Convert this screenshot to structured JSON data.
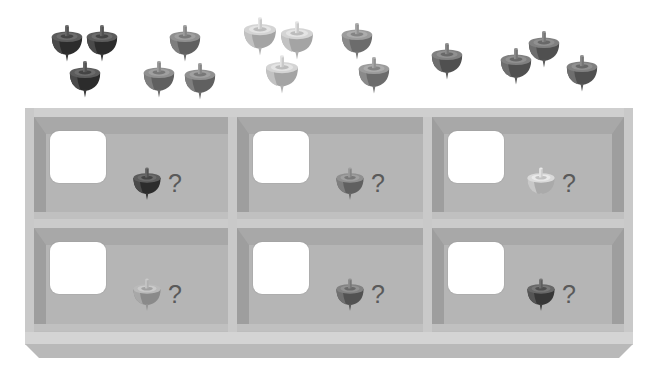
{
  "task": {
    "name": "spinning-tops-counting",
    "instruction_text": "",
    "question_symbol": "?"
  },
  "palette": {
    "background": "#ffffff",
    "shelf_frame": "#cfcfcf",
    "shelf_interior": "#b5b5b5",
    "shelf_ceiling_shadow": "#a8a8a8",
    "shelf_sidewall": "#9e9e9e",
    "answer_box": "#ffffff",
    "question_mark": "#5a5a5a",
    "top_dark": "#4a4a4a",
    "top_medium_dark": "#6e6e6e",
    "top_medium": "#7e7e7e",
    "top_light_medium": "#a3a3a3",
    "top_light": "#c2c2c2"
  },
  "scatter": {
    "label": "scattered-spinning-tops",
    "total_count": 14,
    "groups": [
      {
        "name": "group-dark-left",
        "shade": "dark",
        "color": "#4a4a4a",
        "count": 3,
        "tops": [
          {
            "x": 48,
            "y": 20,
            "size": 38,
            "color": "#4a4a4a"
          },
          {
            "x": 83,
            "y": 20,
            "size": 38,
            "color": "#4a4a4a"
          },
          {
            "x": 66,
            "y": 56,
            "size": 38,
            "color": "#4a4a4a"
          }
        ]
      },
      {
        "name": "group-medium-second",
        "shade": "medium",
        "color": "#7e7e7e",
        "count": 3,
        "tops": [
          {
            "x": 166,
            "y": 20,
            "size": 38,
            "color": "#7e7e7e"
          },
          {
            "x": 140,
            "y": 56,
            "size": 38,
            "color": "#7e7e7e"
          },
          {
            "x": 181,
            "y": 58,
            "size": 38,
            "color": "#7e7e7e"
          }
        ]
      },
      {
        "name": "group-light-third",
        "shade": "light",
        "color": "#c2c2c2",
        "count": 3,
        "tops": [
          {
            "x": 240,
            "y": 12,
            "size": 40,
            "color": "#c2c2c2"
          },
          {
            "x": 277,
            "y": 16,
            "size": 40,
            "color": "#c2c2c2"
          },
          {
            "x": 262,
            "y": 50,
            "size": 40,
            "color": "#c2c2c2"
          }
        ]
      },
      {
        "name": "group-medium-fourth",
        "shade": "medium",
        "color": "#8a8a8a",
        "count": 2,
        "tops": [
          {
            "x": 338,
            "y": 18,
            "size": 38,
            "color": "#8a8a8a"
          },
          {
            "x": 355,
            "y": 52,
            "size": 38,
            "color": "#8a8a8a"
          }
        ]
      },
      {
        "name": "group-medium-dark-right",
        "shade": "medium-dark",
        "color": "#6e6e6e",
        "count": 3,
        "tops": [
          {
            "x": 428,
            "y": 38,
            "size": 38,
            "color": "#6e6e6e"
          },
          {
            "x": 497,
            "y": 43,
            "size": 38,
            "color": "#6e6e6e"
          },
          {
            "x": 525,
            "y": 26,
            "size": 38,
            "color": "#6e6e6e"
          }
        ]
      }
    ],
    "extra_tops": [
      {
        "name": "top-far-right-low",
        "x": 563,
        "y": 50,
        "size": 38,
        "color": "#6e6e6e"
      }
    ]
  },
  "shelf": {
    "label": "shelf-grid",
    "rows": 2,
    "columns": 3,
    "cells": [
      {
        "id": "cell-r1c1",
        "row": 1,
        "column": 1,
        "answer_value": "",
        "reference_top": {
          "shade": "dark",
          "color": "#4a4a4a"
        },
        "question": "?"
      },
      {
        "id": "cell-r1c2",
        "row": 1,
        "column": 2,
        "answer_value": "",
        "reference_top": {
          "shade": "medium",
          "color": "#7e7e7e"
        },
        "question": "?"
      },
      {
        "id": "cell-r1c3",
        "row": 1,
        "column": 3,
        "answer_value": "",
        "reference_top": {
          "shade": "light",
          "color": "#c8c8c8"
        },
        "question": "?"
      },
      {
        "id": "cell-r2c1",
        "row": 2,
        "column": 1,
        "answer_value": "",
        "reference_top": {
          "shade": "light-medium",
          "color": "#a8a8a8"
        },
        "question": "?"
      },
      {
        "id": "cell-r2c2",
        "row": 2,
        "column": 2,
        "answer_value": "",
        "reference_top": {
          "shade": "medium-dark",
          "color": "#707070"
        },
        "question": "?"
      },
      {
        "id": "cell-r2c3",
        "row": 2,
        "column": 3,
        "answer_value": "",
        "reference_top": {
          "shade": "dark",
          "color": "#555555"
        },
        "question": "?"
      }
    ]
  }
}
